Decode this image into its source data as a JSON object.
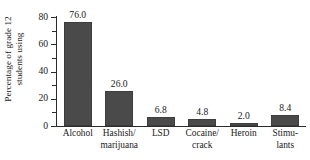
{
  "chart_data": {
    "type": "bar",
    "title": "",
    "xlabel": "",
    "ylabel": "Percentage of grade 12 students using",
    "ylabel_lines": [
      "Percentage of grade 12",
      "students using"
    ],
    "categories": [
      "Alcohol",
      "Hashish/ marijuana",
      "LSD",
      "Cocaine/ crack",
      "Heroin",
      "Stimu- lants"
    ],
    "category_lines": [
      [
        "Alcohol"
      ],
      [
        "Hashish/",
        "marijuana"
      ],
      [
        "LSD"
      ],
      [
        "Cocaine/",
        "crack"
      ],
      [
        "Heroin"
      ],
      [
        "Stimu-",
        "lants"
      ]
    ],
    "values": [
      76.0,
      26.0,
      6.8,
      4.8,
      2.0,
      8.4
    ],
    "value_labels": [
      "76.0",
      "26.0",
      "6.8",
      "4.8",
      "2.0",
      "8.4"
    ],
    "ylim": [
      0,
      80
    ],
    "y_major_ticks": [
      0,
      20,
      40,
      60,
      80
    ],
    "y_major_tick_labels": [
      "0",
      "20",
      "40",
      "60",
      "80"
    ],
    "y_minor_ticks": [
      10,
      30,
      50,
      70
    ],
    "grid": false,
    "legend": false,
    "bar_color": "#4a4a4a",
    "axis_color": "#2b2b2b",
    "background_color": "#ffffff"
  }
}
